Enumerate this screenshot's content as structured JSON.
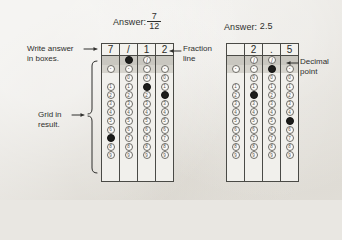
{
  "page": {
    "background_color": "#e9e7e2",
    "ink_color": "#2f2f2d"
  },
  "examples": [
    {
      "id": "fraction-example",
      "answer_prefix": "Answer:",
      "answer_value": "7/12",
      "answer_numerator": "7",
      "answer_denominator": "12",
      "written_row": [
        "7",
        "/",
        "1",
        "2"
      ],
      "columns": [
        {
          "index": 1,
          "written": "7",
          "slash_bubble": "blank",
          "slash_filled": false,
          "dot_filled": false,
          "digits": [
            "0",
            "1",
            "2",
            "3",
            "4",
            "5",
            "6",
            "7",
            "8",
            "9"
          ],
          "digit_visible_from": 1,
          "filled_digit": "7"
        },
        {
          "index": 2,
          "written": "/",
          "slash_bubble": "/",
          "slash_filled": true,
          "dot_filled": false,
          "digits": [
            "0",
            "1",
            "2",
            "3",
            "4",
            "5",
            "6",
            "7",
            "8",
            "9"
          ],
          "digit_visible_from": 0,
          "filled_digit": null
        },
        {
          "index": 3,
          "written": "1",
          "slash_bubble": "/",
          "slash_filled": false,
          "dot_filled": false,
          "digits": [
            "0",
            "1",
            "2",
            "3",
            "4",
            "5",
            "6",
            "7",
            "8",
            "9"
          ],
          "digit_visible_from": 0,
          "filled_digit": "1"
        },
        {
          "index": 4,
          "written": "2",
          "slash_bubble": "blank",
          "slash_filled": false,
          "dot_filled": false,
          "digits": [
            "0",
            "1",
            "2",
            "3",
            "4",
            "5",
            "6",
            "7",
            "8",
            "9"
          ],
          "digit_visible_from": 0,
          "filled_digit": "2"
        }
      ]
    },
    {
      "id": "decimal-example",
      "answer_prefix": "Answer:",
      "answer_value": "2.5",
      "written_row": [
        "",
        "2",
        ".",
        "5"
      ],
      "columns": [
        {
          "index": 1,
          "written": "",
          "slash_bubble": "blank",
          "slash_filled": false,
          "dot_filled": false,
          "digits": [
            "0",
            "1",
            "2",
            "3",
            "4",
            "5",
            "6",
            "7",
            "8",
            "9"
          ],
          "digit_visible_from": 1,
          "filled_digit": null
        },
        {
          "index": 2,
          "written": "2",
          "slash_bubble": "/",
          "slash_filled": false,
          "dot_filled": false,
          "digits": [
            "0",
            "1",
            "2",
            "3",
            "4",
            "5",
            "6",
            "7",
            "8",
            "9"
          ],
          "digit_visible_from": 0,
          "filled_digit": "2"
        },
        {
          "index": 3,
          "written": ".",
          "slash_bubble": "/",
          "slash_filled": false,
          "dot_filled": true,
          "digits": [
            "0",
            "1",
            "2",
            "3",
            "4",
            "5",
            "6",
            "7",
            "8",
            "9"
          ],
          "digit_visible_from": 0,
          "filled_digit": null
        },
        {
          "index": 4,
          "written": "5",
          "slash_bubble": "blank",
          "slash_filled": false,
          "dot_filled": false,
          "digits": [
            "0",
            "1",
            "2",
            "3",
            "4",
            "5",
            "6",
            "7",
            "8",
            "9"
          ],
          "digit_visible_from": 0,
          "filled_digit": "5"
        }
      ]
    }
  ],
  "annotations": {
    "write_answer": "Write answer\nin boxes.",
    "grid_in_result": "Grid in\nresult.",
    "fraction_line": "Fraction\nline",
    "decimal_point": "Decimal\npoint"
  }
}
